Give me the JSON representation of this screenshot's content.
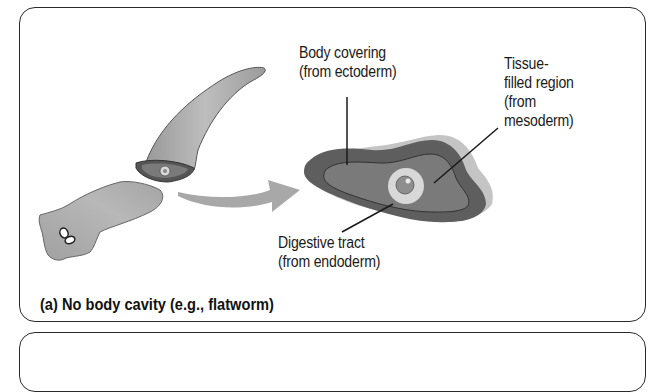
{
  "figure": {
    "panel_a": {
      "caption": "(a) No body cavity (e.g., flatworm)",
      "labels": {
        "body_covering_line1": "Body covering",
        "body_covering_line2": "(from ectoderm)",
        "tissue_line1": "Tissue-",
        "tissue_line2": "filled region",
        "tissue_line3": "(from",
        "tissue_line4": "mesoderm)",
        "digestive_line1": "Digestive tract",
        "digestive_line2": "(from endoderm)"
      },
      "illustration": {
        "subject": "flatworm cut in two with cross-section",
        "arrow": "curved-arrow pointing to cross-section"
      }
    },
    "panel_b": {
      "visible": "top edge only"
    },
    "colors": {
      "worm_body": "#a9a9a9",
      "ectoderm": "#5e5e5e",
      "mesoderm": "#7a7a7a",
      "endoderm_ring": "#d8d8d8",
      "shadow": "#c4c4c4",
      "arrow": "#a8a8a8",
      "outline": "#2a2a2a"
    }
  }
}
